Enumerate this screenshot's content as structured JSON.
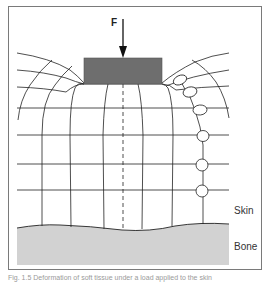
{
  "diagram": {
    "force_label": "F",
    "labels": {
      "skin": "Skin",
      "bone": "Bone"
    },
    "caption": "Fig. 1.5  Deformation of soft tissue under a load applied to the skin",
    "colors": {
      "indenter": "#6e6e6e",
      "bone": "#d2d2d2",
      "grid_lines": "#222222",
      "frame": "#7a7a7a"
    },
    "elements": {
      "force_arrow": "downward arrow applying force F onto indenter",
      "indenter": "dark rectangular block pressing on skin surface",
      "deformation_grid": "curved mesh of tissue lines bending around indenter",
      "centerline": "dashed vertical line through indenter center",
      "cell_chain": "chain of elliptical cells deforming near indenter edge",
      "bone_layer": "light grey region at bottom"
    }
  }
}
